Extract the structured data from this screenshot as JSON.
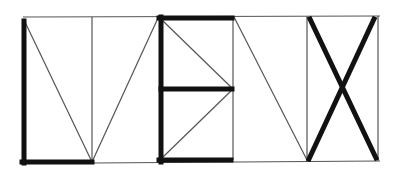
{
  "diagram": {
    "colors": {
      "background": "#ffffff",
      "thin_line": "#555555",
      "thick_line": "#111111"
    },
    "thin_lines": [
      {
        "id": "top-border",
        "x1": 23,
        "y1": 17,
        "x2": 380,
        "y2": 16
      },
      {
        "id": "bottom-border",
        "x1": 92,
        "y1": 163,
        "x2": 380,
        "y2": 161
      },
      {
        "id": "l-guide-vertical",
        "x1": 92,
        "y1": 17,
        "x2": 92,
        "y2": 163
      },
      {
        "id": "l-diagonal-1",
        "x1": 25,
        "y1": 22,
        "x2": 92,
        "y2": 162
      },
      {
        "id": "l-diagonal-2",
        "x1": 92,
        "y1": 162,
        "x2": 158,
        "y2": 18
      },
      {
        "id": "e-guide-vertical",
        "x1": 233,
        "y1": 17,
        "x2": 233,
        "y2": 160
      },
      {
        "id": "e-diagonal-top",
        "x1": 163,
        "y1": 21,
        "x2": 233,
        "y2": 89
      },
      {
        "id": "e-diagonal-bottom",
        "x1": 233,
        "y1": 89,
        "x2": 163,
        "y2": 157
      },
      {
        "id": "n-diagonal",
        "x1": 234,
        "y1": 17,
        "x2": 307,
        "y2": 160
      },
      {
        "id": "x-box-left",
        "x1": 307,
        "y1": 16,
        "x2": 307,
        "y2": 161
      },
      {
        "id": "x-box-right",
        "x1": 378,
        "y1": 16,
        "x2": 378,
        "y2": 161
      }
    ],
    "thick_lines": [
      {
        "id": "l-stem",
        "x1": 24,
        "y1": 21,
        "x2": 24,
        "y2": 163
      },
      {
        "id": "l-foot",
        "x1": 22,
        "y1": 162,
        "x2": 92,
        "y2": 162
      },
      {
        "id": "e-stem",
        "x1": 161,
        "y1": 17,
        "x2": 161,
        "y2": 162
      },
      {
        "id": "e-top-bar",
        "x1": 159,
        "y1": 18,
        "x2": 232,
        "y2": 18
      },
      {
        "id": "e-middle-bar",
        "x1": 161,
        "y1": 89,
        "x2": 232,
        "y2": 89
      },
      {
        "id": "e-bottom-bar",
        "x1": 159,
        "y1": 160,
        "x2": 231,
        "y2": 160
      },
      {
        "id": "x-stroke-1",
        "x1": 310,
        "y1": 19,
        "x2": 376,
        "y2": 158
      },
      {
        "id": "x-stroke-2",
        "x1": 374,
        "y1": 19,
        "x2": 309,
        "y2": 159
      }
    ],
    "thin_width": 1.2,
    "thick_width": 5
  }
}
